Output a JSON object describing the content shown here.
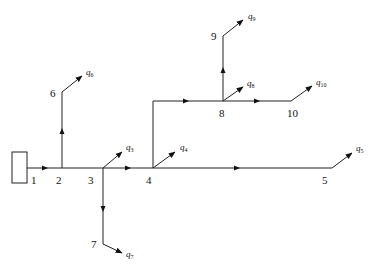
{
  "diagram": {
    "type": "pipe-network",
    "source": {
      "label": "source-box",
      "x": 12,
      "y": 152,
      "w": 15,
      "h": 31
    },
    "nodes": [
      {
        "id": "1",
        "label": "1",
        "x": 30,
        "y": 168,
        "lx": 31,
        "ly": 184
      },
      {
        "id": "2",
        "label": "2",
        "x": 62,
        "y": 168,
        "lx": 56,
        "ly": 184
      },
      {
        "id": "3",
        "label": "3",
        "x": 103,
        "y": 168,
        "lx": 88,
        "ly": 184
      },
      {
        "id": "4",
        "label": "4",
        "x": 153,
        "y": 168,
        "lx": 146,
        "ly": 184
      },
      {
        "id": "5",
        "label": "5",
        "x": 332,
        "y": 168,
        "lx": 322,
        "ly": 184
      },
      {
        "id": "6",
        "label": "6",
        "x": 62,
        "y": 92,
        "lx": 50,
        "ly": 97
      },
      {
        "id": "7",
        "label": "7",
        "x": 103,
        "y": 244,
        "lx": 91,
        "ly": 248
      },
      {
        "id": "8",
        "label": "8",
        "x": 223,
        "y": 101,
        "lx": 219,
        "ly": 117
      },
      {
        "id": "9",
        "label": "9",
        "x": 223,
        "y": 36,
        "lx": 211,
        "ly": 40
      },
      {
        "id": "10",
        "label": "10",
        "x": 291,
        "y": 101,
        "lx": 287,
        "ly": 117
      }
    ],
    "pipes": [
      {
        "from": "1",
        "to": "2",
        "arrow": {
          "x": 48,
          "y": 168,
          "dir": "right"
        }
      },
      {
        "from": "2",
        "to": "3",
        "arrow": null
      },
      {
        "from": "3",
        "to": "4",
        "arrow": {
          "x": 131,
          "y": 168,
          "dir": "right"
        }
      },
      {
        "from": "4",
        "to": "5",
        "arrow": {
          "x": 240,
          "y": 168,
          "dir": "right"
        }
      },
      {
        "from": "2",
        "to": "6",
        "arrow": {
          "x": 62,
          "y": 128,
          "dir": "up"
        }
      },
      {
        "from": "3",
        "to": "7",
        "arrow": {
          "x": 103,
          "y": 212,
          "dir": "down"
        }
      },
      {
        "from": "4",
        "to": "8",
        "via": {
          "x": 153,
          "y": 101
        },
        "arrow": {
          "x": 189,
          "y": 101,
          "dir": "right"
        }
      },
      {
        "from": "8",
        "to": "10",
        "arrow": {
          "x": 260,
          "y": 101,
          "dir": "right"
        }
      },
      {
        "from": "8",
        "to": "9",
        "arrow": {
          "x": 223,
          "y": 67,
          "dir": "up"
        }
      }
    ],
    "outflows": [
      {
        "node": "6",
        "label": "q",
        "sub": "6",
        "x2": 82,
        "y2": 76,
        "lx": 86,
        "ly": 75
      },
      {
        "node": "3",
        "label": "q",
        "sub": "3",
        "x2": 122,
        "y2": 152,
        "lx": 126,
        "ly": 150
      },
      {
        "node": "4",
        "label": "q",
        "sub": "4",
        "x2": 175,
        "y2": 152,
        "lx": 180,
        "ly": 150
      },
      {
        "node": "5",
        "label": "q",
        "sub": "5",
        "x2": 352,
        "y2": 153,
        "lx": 356,
        "ly": 151
      },
      {
        "node": "7",
        "label": "q",
        "sub": "7",
        "x2": 122,
        "y2": 253,
        "lx": 126,
        "ly": 257
      },
      {
        "node": "8",
        "label": "q",
        "sub": "8",
        "x2": 243,
        "y2": 87,
        "lx": 247,
        "ly": 86
      },
      {
        "node": "9",
        "label": "q",
        "sub": "9",
        "x2": 243,
        "y2": 20,
        "lx": 248,
        "ly": 19
      },
      {
        "node": "10",
        "label": "q",
        "sub": "10",
        "x2": 312,
        "y2": 86,
        "lx": 316,
        "ly": 85
      }
    ]
  }
}
